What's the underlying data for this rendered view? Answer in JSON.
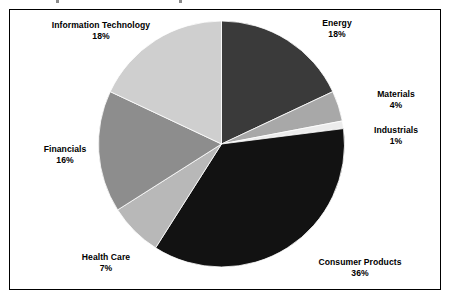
{
  "figure": {
    "background_color": "#ffffff",
    "frame_color": "#000000"
  },
  "chart_data": {
    "type": "pie",
    "title": "",
    "subtitle": "",
    "xlabel": "",
    "ylabel": "",
    "legend_position": "none",
    "label_format": "name + percentage, placed outside slices",
    "start_angle_deg": 0,
    "direction": "clockwise",
    "units": "percent",
    "total": 100,
    "categories": [
      "Energy",
      "Materials",
      "Industrials",
      "Consumer Products",
      "Health Care",
      "Financials",
      "Information Technology"
    ],
    "values": [
      18,
      4,
      1,
      36,
      7,
      16,
      18
    ],
    "value_labels": [
      "18%",
      "4%",
      "1%",
      "36%",
      "7%",
      "16%",
      "18%"
    ],
    "colors": [
      "#3a3a3a",
      "#a8a8a8",
      "#ececec",
      "#121212",
      "#b8b8b8",
      "#8d8d8d",
      "#cfcfcf"
    ],
    "slices": [
      {
        "name": "Energy",
        "value": 18,
        "value_label": "18%",
        "color": "#3a3a3a"
      },
      {
        "name": "Materials",
        "value": 4,
        "value_label": "4%",
        "color": "#a8a8a8"
      },
      {
        "name": "Industrials",
        "value": 1,
        "value_label": "1%",
        "color": "#ececec"
      },
      {
        "name": "Consumer Products",
        "value": 36,
        "value_label": "36%",
        "color": "#121212"
      },
      {
        "name": "Health Care",
        "value": 7,
        "value_label": "7%",
        "color": "#b8b8b8"
      },
      {
        "name": "Financials",
        "value": 16,
        "value_label": "16%",
        "color": "#8d8d8d"
      },
      {
        "name": "Information Technology",
        "value": 18,
        "value_label": "18%",
        "color": "#cfcfcf"
      }
    ]
  }
}
